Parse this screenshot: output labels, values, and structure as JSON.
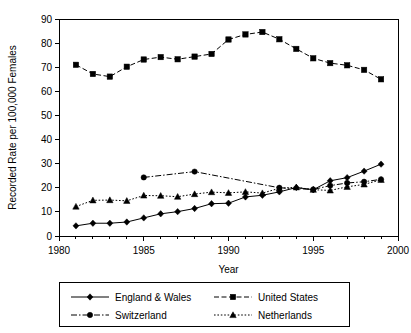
{
  "chart_data": {
    "type": "line",
    "title": "",
    "xlabel": "Year",
    "ylabel": "Recorded Rate per 100,000 Females",
    "xlim": [
      1980,
      2000
    ],
    "ylim": [
      0,
      90
    ],
    "xticks": [
      1980,
      1985,
      1990,
      1995,
      2000
    ],
    "xtick_labels": [
      "1980",
      "1985",
      "1990",
      "1995",
      "2000"
    ],
    "xminor_tick_step": 1,
    "yticks": [
      0,
      10,
      20,
      30,
      40,
      50,
      60,
      70,
      80,
      90
    ],
    "ytick_labels": [
      "0",
      "10",
      "20",
      "30",
      "40",
      "50",
      "60",
      "70",
      "80",
      "90"
    ],
    "grid": false,
    "legend_position": "below",
    "series": [
      {
        "name": "England & Wales",
        "line_style": "solid",
        "marker": "diamond",
        "color": "#000000",
        "x": [
          1981,
          1982,
          1983,
          1984,
          1985,
          1986,
          1987,
          1988,
          1989,
          1990,
          1991,
          1992,
          1993,
          1994,
          1995,
          1996,
          1997,
          1998,
          1999
        ],
        "values": [
          4.2,
          5.3,
          5.3,
          5.8,
          7.5,
          9.2,
          10.1,
          11.4,
          13.4,
          13.6,
          16.2,
          16.9,
          18.3,
          20.1,
          19.2,
          22.9,
          24.2,
          26.9,
          29.8
        ]
      },
      {
        "name": "United States",
        "line_style": "dashed",
        "marker": "square",
        "color": "#000000",
        "x": [
          1981,
          1982,
          1983,
          1984,
          1985,
          1986,
          1987,
          1988,
          1989,
          1990,
          1991,
          1992,
          1993,
          1994,
          1995,
          1996,
          1997,
          1998,
          1999
        ],
        "values": [
          71.0,
          67.2,
          66.1,
          70.2,
          73.2,
          74.2,
          73.3,
          74.4,
          75.5,
          81.5,
          83.6,
          84.6,
          81.6,
          77.6,
          73.7,
          71.7,
          70.8,
          68.9,
          65.0
        ]
      },
      {
        "name": "Switzerland",
        "line_style": "dashdot",
        "marker": "circle",
        "color": "#000000",
        "x": [
          1985,
          1988,
          1993,
          1995,
          1996,
          1997,
          1998,
          1999
        ],
        "values": [
          24.3,
          26.7,
          20.0,
          19.3,
          20.9,
          22.0,
          22.5,
          23.5
        ]
      },
      {
        "name": "Netherlands",
        "line_style": "dotted",
        "marker": "triangle",
        "color": "#000000",
        "x": [
          1981,
          1982,
          1983,
          1984,
          1985,
          1986,
          1987,
          1988,
          1989,
          1990,
          1991,
          1992,
          1993,
          1994,
          1995,
          1996,
          1997,
          1998,
          1999
        ],
        "values": [
          12.2,
          14.8,
          14.9,
          14.6,
          16.8,
          16.7,
          16.3,
          17.4,
          18.2,
          17.9,
          18.3,
          17.8,
          19.8,
          20.2,
          19.2,
          18.9,
          20.4,
          21.4,
          23.3
        ]
      }
    ]
  }
}
